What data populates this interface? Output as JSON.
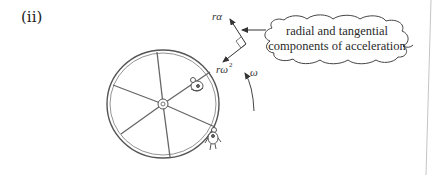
{
  "figure": {
    "part_label": "(ii)",
    "labels": {
      "tangential": "rα",
      "radial_base": "rω",
      "radial_exponent": "2",
      "angular_velocity": "ω"
    },
    "callout": {
      "line1": "radial and tangential",
      "line2": "components of acceleration"
    },
    "colors": {
      "stroke": "#444444",
      "wheel_stroke": "#555555",
      "background": "#ffffff",
      "page_edge": "#bbbbbb"
    }
  }
}
